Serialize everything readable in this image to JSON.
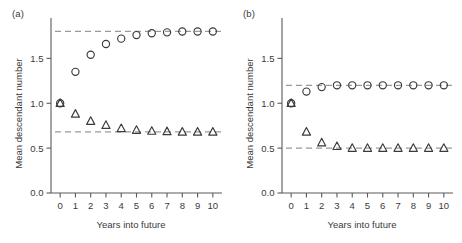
{
  "figure": {
    "panels": [
      {
        "label": "(a)",
        "xlabel": "Years into future",
        "ylabel": "Mean descendant number",
        "y_ticks": [
          "0.0",
          "0.5",
          "1.0",
          "1.5"
        ],
        "y_tick_values": [
          0.0,
          0.5,
          1.0,
          1.5
        ],
        "x_ticks": [
          "0",
          "1",
          "2",
          "3",
          "4",
          "5",
          "6",
          "7",
          "8",
          "9",
          "10"
        ]
      },
      {
        "label": "(b)",
        "xlabel": "Years into future",
        "ylabel": "Mean descendant number",
        "y_ticks": [
          "0.0",
          "0.5",
          "1.0",
          "1.5"
        ],
        "y_tick_values": [
          0.0,
          0.5,
          1.0,
          1.5
        ],
        "x_ticks": [
          "0",
          "1",
          "2",
          "3",
          "4",
          "5",
          "6",
          "7",
          "8",
          "9",
          "10"
        ]
      }
    ]
  },
  "chart_data": [
    {
      "type": "scatter",
      "panel": "(a)",
      "title": "",
      "xlabel": "Years into future",
      "ylabel": "Mean descendant number",
      "xlim": [
        -0.6,
        10.6
      ],
      "ylim": [
        0.0,
        1.95
      ],
      "grid": false,
      "legend": "none",
      "x": [
        0,
        1,
        2,
        3,
        4,
        5,
        6,
        7,
        8,
        9,
        10
      ],
      "series": [
        {
          "name": "circles",
          "marker": "open-circle",
          "values": [
            1.0,
            1.35,
            1.54,
            1.66,
            1.72,
            1.76,
            1.78,
            1.79,
            1.8,
            1.8,
            1.8
          ]
        },
        {
          "name": "triangles",
          "marker": "open-triangle",
          "values": [
            1.0,
            0.88,
            0.8,
            0.755,
            0.72,
            0.7,
            0.69,
            0.685,
            0.68,
            0.68,
            0.68
          ]
        }
      ],
      "asymptotes": [
        {
          "name": "circle-asymptote",
          "value": 1.8,
          "style": "dashed"
        },
        {
          "name": "triangle-asymptote",
          "value": 0.68,
          "style": "dashed"
        }
      ]
    },
    {
      "type": "scatter",
      "panel": "(b)",
      "title": "",
      "xlabel": "Years into future",
      "ylabel": "Mean descendant number",
      "xlim": [
        -0.6,
        10.6
      ],
      "ylim": [
        0.0,
        1.95
      ],
      "grid": false,
      "legend": "none",
      "x": [
        0,
        1,
        2,
        3,
        4,
        5,
        6,
        7,
        8,
        9,
        10
      ],
      "series": [
        {
          "name": "circles",
          "marker": "open-circle",
          "values": [
            1.0,
            1.13,
            1.18,
            1.2,
            1.2,
            1.2,
            1.2,
            1.2,
            1.2,
            1.2,
            1.2
          ]
        },
        {
          "name": "triangles",
          "marker": "open-triangle",
          "values": [
            1.0,
            0.68,
            0.56,
            0.52,
            0.5,
            0.5,
            0.5,
            0.5,
            0.5,
            0.5,
            0.5
          ]
        }
      ],
      "asymptotes": [
        {
          "name": "circle-asymptote",
          "value": 1.2,
          "style": "dashed"
        },
        {
          "name": "triangle-asymptote",
          "value": 0.5,
          "style": "dashed"
        }
      ]
    }
  ],
  "style": {
    "marker_stroke": "#3a3a3a",
    "marker_fill": "none",
    "asymptote_color": "#9a9a9a",
    "axis_color": "#5a5a5a",
    "text_color": "#3a3a3a",
    "background": "#ffffff"
  }
}
